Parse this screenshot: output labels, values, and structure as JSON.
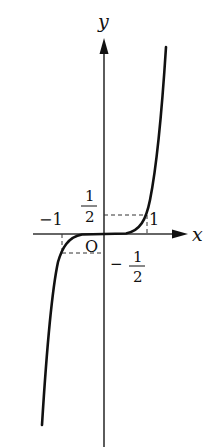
{
  "figure": {
    "type": "function-graph",
    "function": "y = (1/2) x^3",
    "axes": {
      "x_label": "x",
      "y_label": "y",
      "origin_label": "O"
    },
    "tick_labels": {
      "x_pos": "1",
      "x_neg": "−1",
      "y_pos_num": "1",
      "y_pos_den": "2",
      "y_neg_sign": "−",
      "y_neg_num": "1",
      "y_neg_den": "2"
    },
    "marked_points": [
      {
        "x": 1,
        "y": 0.5
      },
      {
        "x": -1,
        "y": -0.5
      }
    ],
    "colors": {
      "curve": "#111111",
      "axis": "#333333",
      "dashes": "#333333"
    }
  }
}
